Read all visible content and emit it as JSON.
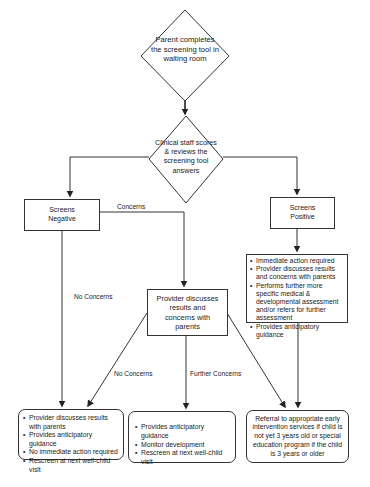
{
  "diagram": {
    "type": "flowchart",
    "start": {
      "text": "Parent completes the screening tool in waiting room",
      "shape": "diamond"
    },
    "decision": {
      "text": "Clinical staff scores & reviews the screening tool answers",
      "shape": "diamond"
    },
    "screens_negative": {
      "text": "Screens Negative"
    },
    "screens_positive": {
      "text": "Screens Positive"
    },
    "positive_actions": {
      "items": [
        "Immediate action required",
        "Provider discusses results and concerns with parents",
        "Performs further more specific medical & developmental assessment and/or refers for further assessment",
        "Provides anticipatory guidance"
      ]
    },
    "provider_discusses": {
      "text": "Provider discusses results and concerns with parents"
    },
    "outcome_no_concerns": {
      "items": [
        "Provider discusses results with parents",
        "Provides anticipatory guidance",
        "No immediate action required",
        "Rescreen at next well-child visit"
      ]
    },
    "outcome_further_concerns": {
      "items": [
        "Provides anticipatory guidance",
        "Monitor development",
        "Rescreen at next well-child visit"
      ]
    },
    "outcome_referral": {
      "text": "Referral to appropriate early intervention services if child is not yet 3 years old or special education program if the child is 3 years or older"
    },
    "edge_labels": {
      "concerns": "Concerns",
      "no_concerns_left": "No Concerns",
      "no_concerns_diag": "No Concerns",
      "further_concerns": "Further Concerns"
    },
    "colors": {
      "line": "#333333",
      "fill": "#ffffff",
      "text": "#222222"
    }
  }
}
